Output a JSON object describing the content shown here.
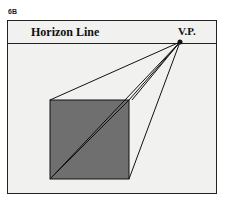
{
  "figure": {
    "label": "6B",
    "horizon_label": "Horizon Line",
    "vanishing_point_label": "V.P.",
    "colors": {
      "background": "#f1f1ef",
      "square_fill": "#6f6f6f",
      "line": "#111111"
    }
  }
}
